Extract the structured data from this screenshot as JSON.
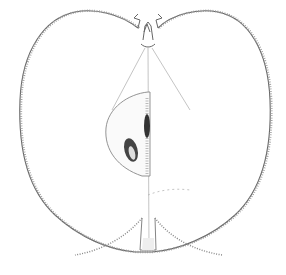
{
  "image": {
    "subject": "Botanical line drawing of an apple, longitudinal cross-section",
    "background_color": "#ffffff",
    "line_color": "#555555",
    "parts": [
      "outer-skin-outline",
      "stem-cavity",
      "stem",
      "core-chamber",
      "seed-left",
      "seed-right",
      "core-line",
      "calyx-tube"
    ]
  }
}
